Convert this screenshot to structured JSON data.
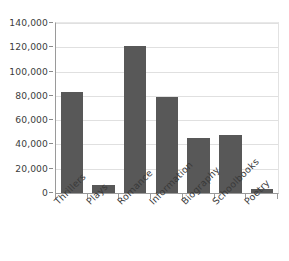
{
  "chart_data": {
    "type": "bar",
    "title": "",
    "xlabel": "",
    "ylabel": "",
    "categories": [
      "Thrillers",
      "Plays",
      "Romance",
      "Information",
      "Biography",
      "Schoolbooks",
      "Poetry"
    ],
    "values": [
      83000,
      7000,
      121000,
      79000,
      45000,
      47500,
      3000
    ],
    "ylim": [
      0,
      140000
    ],
    "ytick_labels": [
      "140,000",
      "120,000",
      "100,000",
      "80,000",
      "60,000",
      "40,000",
      "20,000",
      "0"
    ],
    "ytick_values": [
      140000,
      120000,
      100000,
      80000,
      60000,
      40000,
      20000,
      0
    ],
    "grid": true,
    "legend": false,
    "colors": {
      "bar": "#585858",
      "gridline": "#e0e0e0",
      "axis": "#9a9a9a",
      "text": "#3a3a3a",
      "background": "#ffffff"
    }
  }
}
